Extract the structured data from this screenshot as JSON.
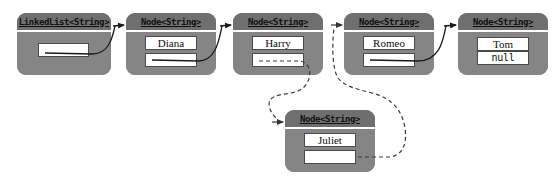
{
  "diagram": {
    "background_color": "#ffffff",
    "box_fill_color": "#858585",
    "box_title_color": "#6f6f6f",
    "field_fill_color": "#ffffff",
    "line_color": "#1a1a1a",
    "dashed_line_color": "#555555"
  },
  "list_object": {
    "type_label": "LinkedList<String>",
    "head_field_value": ""
  },
  "nodes": [
    {
      "type_label": "Node<String>",
      "data_value": "Diana",
      "next_value": "",
      "next_style": "solid"
    },
    {
      "type_label": "Node<String>",
      "data_value": "Harry",
      "next_value": "",
      "next_style": "dashed"
    },
    {
      "type_label": "Node<String>",
      "data_value": "Romeo",
      "next_value": "",
      "next_style": "solid"
    },
    {
      "type_label": "Node<String>",
      "data_value": "Tom",
      "next_value": "null",
      "next_style": "none"
    },
    {
      "type_label": "Node<String>",
      "data_value": "Juliet",
      "next_value": "",
      "next_style": "dashed"
    }
  ],
  "links": [
    {
      "from": "list-head",
      "to": "node-diana",
      "style": "solid"
    },
    {
      "from": "node-diana",
      "to": "node-harry",
      "style": "solid"
    },
    {
      "from": "node-harry",
      "to": "node-juliet",
      "style": "dashed"
    },
    {
      "from": "node-juliet",
      "to": "node-romeo",
      "style": "dashed"
    },
    {
      "from": "node-romeo",
      "to": "node-tom",
      "style": "solid"
    }
  ]
}
